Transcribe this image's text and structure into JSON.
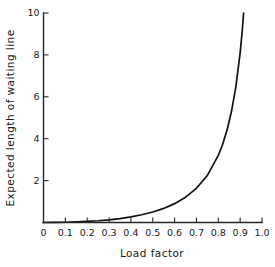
{
  "chart_data": {
    "type": "line",
    "title": "",
    "xlabel": "Load factor",
    "ylabel": "Expected length of waiting line",
    "xlim": [
      0,
      1.0
    ],
    "ylim": [
      0,
      10
    ],
    "grid": false,
    "legend": false,
    "legend_position": "none",
    "x_ticks": [
      0,
      0.1,
      0.2,
      0.3,
      0.4,
      0.5,
      0.6,
      0.7,
      0.8,
      0.9,
      1.0
    ],
    "x_tick_labels": [
      "0",
      "0.1",
      "0.2",
      "0.3",
      "0.4",
      "0.5",
      "0.6",
      "0.7",
      "0.8",
      "0.9",
      "1.0"
    ],
    "y_ticks": [
      2,
      4,
      6,
      8,
      10
    ],
    "y_tick_labels": [
      "2",
      "4",
      "6",
      "8",
      "10"
    ],
    "series": [
      {
        "name": "Expected length of waiting line",
        "color": "#111111",
        "x": [
          0.0,
          0.05,
          0.1,
          0.15,
          0.2,
          0.25,
          0.3,
          0.35,
          0.4,
          0.45,
          0.5,
          0.55,
          0.6,
          0.65,
          0.7,
          0.75,
          0.8,
          0.82,
          0.84,
          0.86,
          0.88,
          0.9,
          0.91,
          0.92,
          0.93,
          0.94,
          0.945,
          0.95
        ],
        "y": [
          0.0,
          0.003,
          0.011,
          0.026,
          0.05,
          0.083,
          0.129,
          0.188,
          0.267,
          0.368,
          0.5,
          0.672,
          0.9,
          1.207,
          1.633,
          2.25,
          3.2,
          3.736,
          4.41,
          5.283,
          6.453,
          8.1,
          9.201,
          10.58,
          12.356,
          14.727,
          16.305,
          18.05
        ]
      }
    ],
    "annotations": []
  },
  "figure": {
    "background_color": "#ffffff",
    "axis_color": "#262626",
    "curve_color": "#111111"
  }
}
